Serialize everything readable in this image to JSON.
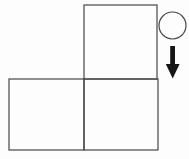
{
  "canvas": {
    "width": 189,
    "height": 159,
    "background": "#fdfdfd"
  },
  "diagram": {
    "outline_color": "#474747",
    "outline_width": 1.2,
    "arrow_color": "#161616",
    "shape_fill": "#fdfdfd",
    "shapes": [
      {
        "type": "rect",
        "name": "top-square",
        "x": 84,
        "y": 5,
        "width": 73,
        "height": 74
      },
      {
        "type": "rect",
        "name": "bottom-left-square",
        "x": 9,
        "y": 79,
        "width": 75,
        "height": 71
      },
      {
        "type": "rect",
        "name": "bottom-right-square",
        "x": 84,
        "y": 79,
        "width": 74,
        "height": 71
      },
      {
        "type": "circle",
        "name": "ball-circle",
        "cx": 172.5,
        "cy": 25.5,
        "r": 13.5
      },
      {
        "type": "arrow",
        "name": "down-arrow",
        "shaft": {
          "x": 170.2,
          "y": 46,
          "width": 4.8,
          "height": 20
        },
        "head": {
          "points": "165.8,64 179.6,64 172.7,78.5"
        }
      }
    ]
  }
}
